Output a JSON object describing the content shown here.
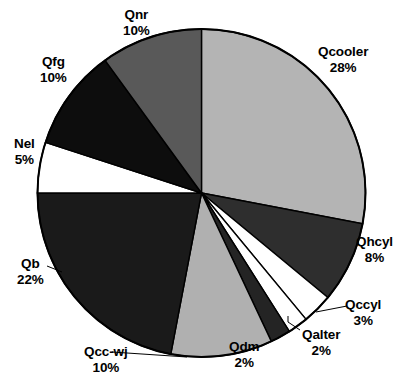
{
  "chart_data": {
    "type": "pie",
    "title": "",
    "xlabel": "",
    "ylabel": "",
    "legend_position": "none",
    "grid": false,
    "start_angle_deg": 0,
    "direction": "clockwise",
    "units": "percent",
    "categories": [
      "Qcooler",
      "Qhcyl",
      "Qccyl",
      "Qalter",
      "Qdm",
      "Qcc-wj",
      "Qb",
      "Nel",
      "Qfg",
      "Qnr"
    ],
    "values": [
      28,
      8,
      3,
      2,
      2,
      10,
      22,
      5,
      10,
      10
    ],
    "labels": [
      "28%",
      "8%",
      "3%",
      "2%",
      "2%",
      "10%",
      "22%",
      "5%",
      "10%",
      "10%"
    ],
    "colors": [
      "#b4b4b4",
      "#2e2e2e",
      "#ffffff",
      "#ffffff",
      "#242424",
      "#b0b0b0",
      "#1a1a1a",
      "#ffffff",
      "#0d0d0d",
      "#595959"
    ],
    "slices": [
      {
        "name": "Qcooler",
        "value": 28,
        "label": "28%",
        "color": "#b4b4b4",
        "leader_line": false
      },
      {
        "name": "Qhcyl",
        "value": 8,
        "label": "8%",
        "color": "#2e2e2e",
        "leader_line": false
      },
      {
        "name": "Qccyl",
        "value": 3,
        "label": "3%",
        "color": "#ffffff",
        "leader_line": true
      },
      {
        "name": "Qalter",
        "value": 2,
        "label": "2%",
        "color": "#ffffff",
        "leader_line": true
      },
      {
        "name": "Qdm",
        "value": 2,
        "label": "2%",
        "color": "#242424",
        "leader_line": false
      },
      {
        "name": "Qcc-wj",
        "value": 10,
        "label": "10%",
        "color": "#b0b0b0",
        "leader_line": true
      },
      {
        "name": "Qb",
        "value": 22,
        "label": "22%",
        "color": "#1a1a1a",
        "leader_line": true
      },
      {
        "name": "Nel",
        "value": 5,
        "label": "5%",
        "color": "#ffffff",
        "leader_line": false
      },
      {
        "name": "Qfg",
        "value": 10,
        "label": "10%",
        "color": "#0d0d0d",
        "leader_line": false
      },
      {
        "name": "Qnr",
        "value": 10,
        "label": "10%",
        "color": "#595959",
        "leader_line": false
      }
    ]
  },
  "labels": {
    "qcooler": {
      "name": "Qcooler",
      "pct": "28%"
    },
    "qhcyl": {
      "name": "Qhcyl",
      "pct": "8%"
    },
    "qccyl": {
      "name": "Qccyl",
      "pct": "3%"
    },
    "qalter": {
      "name": "Qalter",
      "pct": "2%"
    },
    "qdm": {
      "name": "Qdm",
      "pct": "2%"
    },
    "qccwj": {
      "name": "Qcc-wj",
      "pct": "10%"
    },
    "qb": {
      "name": "Qb",
      "pct": "22%"
    },
    "nel": {
      "name": "Nel",
      "pct": "5%"
    },
    "qfg": {
      "name": "Qfg",
      "pct": "10%"
    },
    "qnr": {
      "name": "Qnr",
      "pct": "10%"
    }
  },
  "style": {
    "outline_color": "#000000",
    "background": "#ffffff",
    "text_color": "#000000"
  }
}
